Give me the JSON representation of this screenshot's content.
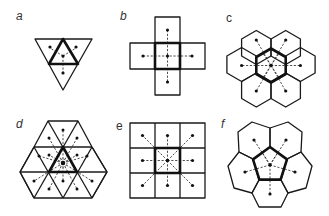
{
  "figure": {
    "panels": [
      {
        "id": "a",
        "label": "a",
        "lattice": "triangular",
        "neighbors": 3
      },
      {
        "id": "b",
        "label": "b",
        "lattice": "square",
        "neighbors": 4
      },
      {
        "id": "c",
        "label": "c",
        "lattice": "hexagonal",
        "neighbors": 6
      },
      {
        "id": "d",
        "label": "d",
        "lattice": "triangular",
        "neighbors": 12
      },
      {
        "id": "e",
        "label": "e",
        "lattice": "square",
        "neighbors": 8
      },
      {
        "id": "f",
        "label": "f",
        "lattice": "pentagonal",
        "neighbors": 5
      }
    ],
    "colors": {
      "stroke": "#111111",
      "background": "#ffffff",
      "label": "#333333"
    }
  }
}
